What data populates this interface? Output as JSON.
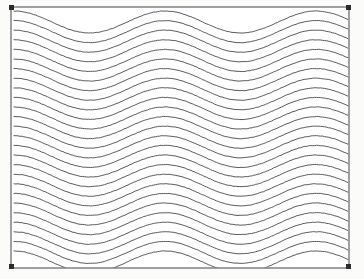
{
  "document": {
    "title": "Sinusoidal Wave Field",
    "type": "line-art-figure",
    "background_color": "#fbfbfa",
    "canvas": {
      "width": 364,
      "height": 279
    }
  },
  "frame": {
    "name": "selection-frame",
    "x": 11,
    "y": 7,
    "width": 338,
    "height": 261,
    "stroke_color": "#55555a",
    "stroke_width": 1.1,
    "fill_color": "#ffffff"
  },
  "handles": {
    "size": 5,
    "color": "#2b2b2b",
    "positions": [
      {
        "name": "handle-top-left",
        "x": 9,
        "y": 5
      },
      {
        "name": "handle-top-right",
        "x": 346,
        "y": 5
      },
      {
        "name": "handle-bottom-left",
        "x": 9,
        "y": 264
      },
      {
        "name": "handle-bottom-right",
        "x": 346,
        "y": 264
      }
    ]
  },
  "chart_data": {
    "type": "line",
    "xlabel": "",
    "ylabel": "",
    "xlim": [
      0,
      364
    ],
    "ylim": [
      0,
      279
    ],
    "grid": false,
    "legend": "none",
    "series_count": 26,
    "wave": {
      "form": "sine",
      "amplitude": 11,
      "wavelength": 151,
      "phase_deg": 90,
      "x_start": 14,
      "x_end": 348,
      "first_baseline_y": 22,
      "line_spacing": 9.6,
      "samples_per_curve": 170,
      "stroke_color": "#3a3a3e",
      "stroke_width": 0.85,
      "jitter_amplitude": 0.42
    },
    "peaks_x": [
      65,
      216,
      367
    ],
    "troughs_x": [
      -10,
      141,
      292
    ],
    "series": [
      {
        "name": "curve-01",
        "baseline_y": 22
      },
      {
        "name": "curve-02",
        "baseline_y": 31.6
      },
      {
        "name": "curve-03",
        "baseline_y": 41.2
      },
      {
        "name": "curve-04",
        "baseline_y": 50.8
      },
      {
        "name": "curve-05",
        "baseline_y": 60.4
      },
      {
        "name": "curve-06",
        "baseline_y": 70.0
      },
      {
        "name": "curve-07",
        "baseline_y": 79.6
      },
      {
        "name": "curve-08",
        "baseline_y": 89.2
      },
      {
        "name": "curve-09",
        "baseline_y": 98.8
      },
      {
        "name": "curve-10",
        "baseline_y": 108.4
      },
      {
        "name": "curve-11",
        "baseline_y": 118.0
      },
      {
        "name": "curve-12",
        "baseline_y": 127.6
      },
      {
        "name": "curve-13",
        "baseline_y": 137.2
      },
      {
        "name": "curve-14",
        "baseline_y": 146.8
      },
      {
        "name": "curve-15",
        "baseline_y": 156.4
      },
      {
        "name": "curve-16",
        "baseline_y": 166.0
      },
      {
        "name": "curve-17",
        "baseline_y": 175.6
      },
      {
        "name": "curve-18",
        "baseline_y": 185.2
      },
      {
        "name": "curve-19",
        "baseline_y": 194.8
      },
      {
        "name": "curve-20",
        "baseline_y": 204.4
      },
      {
        "name": "curve-21",
        "baseline_y": 214.0
      },
      {
        "name": "curve-22",
        "baseline_y": 223.6
      },
      {
        "name": "curve-23",
        "baseline_y": 233.2
      },
      {
        "name": "curve-24",
        "baseline_y": 242.8
      },
      {
        "name": "curve-25",
        "baseline_y": 252.4
      },
      {
        "name": "curve-26",
        "baseline_y": 262.0
      }
    ]
  }
}
